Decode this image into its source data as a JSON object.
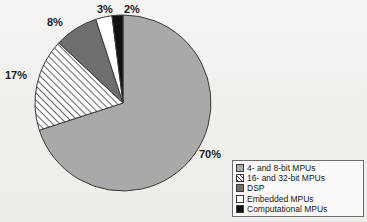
{
  "chart_data": {
    "type": "pie",
    "title": "",
    "subtitle": "",
    "xlabel": "",
    "ylabel": "",
    "grid": false,
    "legend_position": "bottom-right",
    "units": "percent",
    "categories": [
      "4- and 8-bit MPUs",
      "16- and 32-bit MPUs",
      "DSP",
      "Embedded MPUs",
      "Computational MPUs"
    ],
    "values": [
      70,
      17,
      8,
      3,
      2
    ],
    "data_labels": [
      "70%",
      "17%",
      "8%",
      "3%",
      "2%"
    ],
    "slices": [
      {
        "label": "4- and 8-bit MPUs",
        "value": 70,
        "data_label": "70%",
        "color": "#a9a9a9",
        "fill": "solid",
        "start_angle_deg": 7.2,
        "end_angle_deg": 259.2
      },
      {
        "label": "16- and 32-bit MPUs",
        "value": 17,
        "data_label": "17%",
        "color": "#ffffff",
        "fill": "diagonal-hatch",
        "start_angle_deg": 259.2,
        "end_angle_deg": 320.4
      },
      {
        "label": "DSP",
        "value": 8,
        "data_label": "8%",
        "color": "#6e6e6e",
        "fill": "solid",
        "start_angle_deg": 320.4,
        "end_angle_deg": 349.2
      },
      {
        "label": "Embedded MPUs",
        "value": 3,
        "data_label": "3%",
        "color": "#ffffff",
        "fill": "solid",
        "start_angle_deg": 349.2,
        "end_angle_deg": 360.0
      },
      {
        "label": "Computational MPUs",
        "value": 2,
        "data_label": "2%",
        "color": "#111111",
        "fill": "solid",
        "start_angle_deg": 0.0,
        "end_angle_deg": 7.2
      }
    ]
  },
  "legend": {
    "items": [
      {
        "label": "4- and 8-bit MPUs",
        "swatch": "solid-light-gray"
      },
      {
        "label": "16- and 32-bit MPUs",
        "swatch": "diagonal-hatch"
      },
      {
        "label": "DSP",
        "swatch": "solid-dark-gray"
      },
      {
        "label": "Embedded MPUs",
        "swatch": "solid-white"
      },
      {
        "label": "Computational MPUs",
        "swatch": "solid-black"
      }
    ]
  },
  "labels": {
    "pct_70": "70%",
    "pct_17": "17%",
    "pct_8": "8%",
    "pct_3": "3%",
    "pct_2": "2%"
  },
  "background_bleed": {
    "line1": "ultra-faint-text",
    "line2": "ultra-faint-heading",
    "line3": "ultra-faint-text",
    "line4": "ultra-faint-text",
    "line5": "ultra-faint-text",
    "line6": "ultra-faint-text",
    "line7": "ultra-faint-text",
    "line8": "ultra-faint-text",
    "line9": "ultra-faint-text",
    "line10": "ultra-faint-text",
    "line11": "ultra-faint-text"
  },
  "colors": {
    "page_background": "#f2f1ef",
    "slice_primary": "#a9a9a9",
    "slice_dsp": "#6e6e6e",
    "slice_embedded": "#ffffff",
    "slice_computational": "#111111",
    "outline": "#3a3a3a",
    "legend_border": "#6d6d6d",
    "text": "#161616"
  }
}
